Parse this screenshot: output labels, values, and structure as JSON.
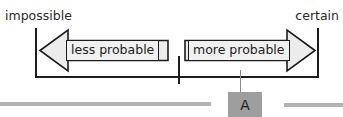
{
  "scale": {
    "left_end_label": "impossible",
    "right_end_label": "certain",
    "ticks": [
      "impossible-end",
      "midpoint",
      "certain-end"
    ]
  },
  "arrows": {
    "left": {
      "caption": "less probable",
      "direction": "left",
      "icon": "arrow-left-icon",
      "fill_color": "#ececec",
      "stroke_color": "#1c1c1c"
    },
    "right": {
      "caption": "more probable",
      "direction": "right",
      "icon": "arrow-right-icon",
      "fill_color": "#ececec",
      "stroke_color": "#1c1c1c"
    }
  },
  "marker": {
    "label": "A",
    "box_color": "#9e9e9e",
    "leader_color": "#8a8a8a"
  },
  "decoration": {
    "rule_color": "#b3b3b3"
  }
}
